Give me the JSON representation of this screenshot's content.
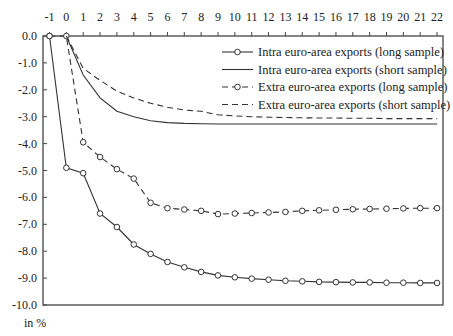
{
  "chart_data": {
    "type": "line",
    "title": "",
    "xlabel": "",
    "ylabel": "in %",
    "xlim": [
      -1,
      22
    ],
    "ylim": [
      -10.0,
      0.0
    ],
    "x_ticks": [
      -1,
      0,
      1,
      2,
      3,
      4,
      5,
      6,
      7,
      8,
      9,
      10,
      11,
      12,
      13,
      14,
      15,
      16,
      17,
      18,
      19,
      20,
      21,
      22
    ],
    "y_ticks": [
      "0.0",
      "-1.0",
      "-2.0",
      "-3.0",
      "-4.0",
      "-5.0",
      "-6.0",
      "-7.0",
      "-8.0",
      "-9.0",
      "-10.0"
    ],
    "x_axis_position": "top",
    "grid": false,
    "legend_position": "upper right (inside)",
    "series": [
      {
        "name": "Intra euro-area exports (long sample)",
        "style": "solid-marker",
        "x": [
          -1,
          0,
          1,
          2,
          3,
          4,
          5,
          6,
          7,
          8,
          9,
          10,
          11,
          12,
          13,
          14,
          15,
          16,
          17,
          18,
          19,
          20,
          21,
          22
        ],
        "values": [
          0.0,
          -4.9,
          -5.1,
          -6.6,
          -7.1,
          -7.75,
          -8.1,
          -8.4,
          -8.6,
          -8.77,
          -8.9,
          -8.97,
          -9.02,
          -9.06,
          -9.1,
          -9.12,
          -9.14,
          -9.15,
          -9.16,
          -9.16,
          -9.17,
          -9.17,
          -9.18,
          -9.18
        ]
      },
      {
        "name": "Intra euro-area exports (short sample)",
        "style": "solid",
        "x": [
          0,
          1,
          2,
          3,
          4,
          5,
          6,
          7,
          8,
          9,
          10,
          11,
          12,
          13,
          14,
          15,
          16,
          17,
          18,
          19,
          20,
          21,
          22
        ],
        "values": [
          0.0,
          -1.45,
          -2.3,
          -2.8,
          -3.0,
          -3.15,
          -3.22,
          -3.25,
          -3.26,
          -3.27,
          -3.27,
          -3.27,
          -3.27,
          -3.27,
          -3.27,
          -3.27,
          -3.27,
          -3.27,
          -3.27,
          -3.27,
          -3.27,
          -3.27,
          -3.27
        ]
      },
      {
        "name": "Extra euro-area exports (long sample)",
        "style": "dashed-marker",
        "x": [
          -1,
          0,
          1,
          2,
          3,
          4,
          5,
          6,
          7,
          8,
          9,
          10,
          11,
          12,
          13,
          14,
          15,
          16,
          17,
          18,
          19,
          20,
          21,
          22
        ],
        "values": [
          0.0,
          0.0,
          -3.95,
          -4.5,
          -4.95,
          -5.3,
          -6.2,
          -6.4,
          -6.45,
          -6.5,
          -6.62,
          -6.6,
          -6.58,
          -6.56,
          -6.54,
          -6.5,
          -6.48,
          -6.46,
          -6.44,
          -6.43,
          -6.42,
          -6.41,
          -6.4,
          -6.4
        ]
      },
      {
        "name": "Extra euro-area exports (short sample)",
        "style": "dashed",
        "x": [
          0,
          1,
          2,
          3,
          4,
          5,
          6,
          7,
          8,
          9,
          10,
          11,
          12,
          13,
          14,
          15,
          16,
          17,
          18,
          19,
          20,
          21,
          22
        ],
        "values": [
          0.0,
          -1.2,
          -1.65,
          -2.05,
          -2.3,
          -2.5,
          -2.65,
          -2.75,
          -2.8,
          -2.93,
          -2.97,
          -3.0,
          -3.02,
          -3.03,
          -3.04,
          -3.05,
          -3.05,
          -3.06,
          -3.06,
          -3.07,
          -3.07,
          -3.07,
          -3.07
        ]
      }
    ]
  },
  "colors": {
    "line": "#333333",
    "axis": "#444444",
    "background": "#ffffff"
  }
}
